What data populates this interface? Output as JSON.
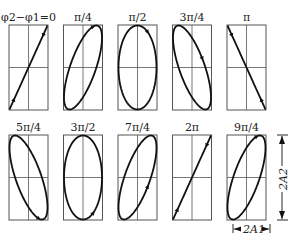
{
  "diagram": {
    "rows": [
      {
        "panels": [
          {
            "label": "φ2−φ1=0",
            "phase_deg": 0
          },
          {
            "label": "π/4",
            "phase_deg": 45
          },
          {
            "label": "π/2",
            "phase_deg": 90
          },
          {
            "label": "3π/4",
            "phase_deg": 135
          },
          {
            "label": "π",
            "phase_deg": 180
          }
        ]
      },
      {
        "panels": [
          {
            "label": "5π/4",
            "phase_deg": 225
          },
          {
            "label": "3π/2",
            "phase_deg": 270
          },
          {
            "label": "7π/4",
            "phase_deg": 315
          },
          {
            "label": "2π",
            "phase_deg": 360
          },
          {
            "label": "9π/4",
            "phase_deg": 405
          }
        ]
      }
    ],
    "dimensions": {
      "width_label": "2A1",
      "height_label": "2A2"
    }
  }
}
